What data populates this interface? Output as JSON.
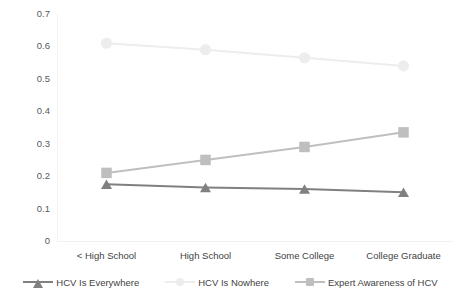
{
  "chart_data": {
    "type": "line",
    "title": "",
    "subtitle": "",
    "xlabel": "",
    "ylabel": "",
    "categories": [
      "< High School",
      "High School",
      "Some College",
      "College Graduate"
    ],
    "ylim": [
      0,
      0.7
    ],
    "y_ticks": [
      "0.7",
      "0.6",
      "0.5",
      "0.4",
      "0.3",
      "0.2",
      "0.1",
      "0"
    ],
    "y_tick_values": [
      0.7,
      0.6,
      0.5,
      0.4,
      0.3,
      0.2,
      0.1,
      0
    ],
    "grid": false,
    "legend_position": "bottom",
    "series": [
      {
        "name": "HCV Is Everywhere",
        "marker": "triangle",
        "color": "#808080",
        "values": [
          0.175,
          0.165,
          0.16,
          0.15
        ]
      },
      {
        "name": "HCV Is Nowhere",
        "marker": "circle",
        "color": "#ededed",
        "values": [
          0.61,
          0.59,
          0.565,
          0.54
        ]
      },
      {
        "name": "Expert Awareness of HCV",
        "marker": "square",
        "color": "#bfbfbf",
        "values": [
          0.21,
          0.25,
          0.29,
          0.335
        ]
      }
    ]
  },
  "legend": {
    "items": [
      {
        "label": "HCV Is Everywhere"
      },
      {
        "label": "HCV Is Nowhere"
      },
      {
        "label": "Expert Awareness of HCV"
      }
    ]
  },
  "axis": {
    "y_labels": [
      "0.7",
      "0.6",
      "0.5",
      "0.4",
      "0.3",
      "0.2",
      "0.1",
      "0"
    ],
    "x_labels": [
      "< High School",
      "High School",
      "Some College",
      "College Graduate"
    ]
  },
  "colors": {
    "series_everywhere": "#808080",
    "series_nowhere": "#ededed",
    "series_expert": "#bfbfbf",
    "axis": "#f2f2f2",
    "text": "#3f3f3f",
    "background": "#ffffff"
  }
}
